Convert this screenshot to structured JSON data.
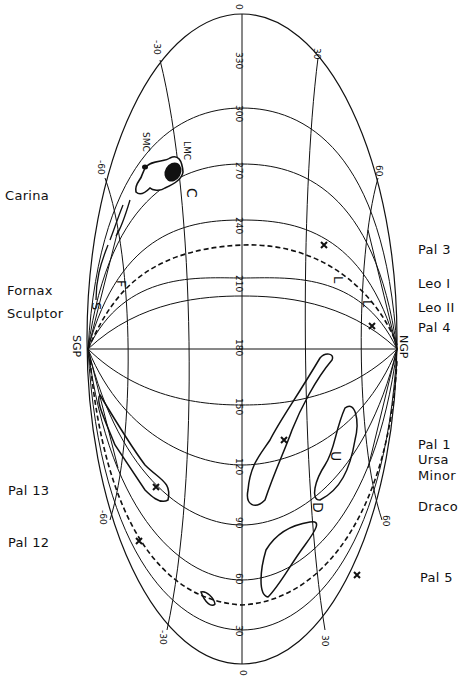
{
  "figure": {
    "projection": "Aitoff (rotated 90°)",
    "poles": {
      "left": "SGP",
      "right": "NGP"
    },
    "meridian_labels": [
      "0",
      "330",
      "300",
      "270",
      "240",
      "210",
      "180",
      "150",
      "120",
      "90",
      "60",
      "30",
      "0"
    ],
    "latitude_labels": {
      "top_left": [
        "-30",
        "-60"
      ],
      "top_right": [
        "30",
        "60"
      ],
      "bottom_left": [
        "-60",
        "-30"
      ],
      "bottom_right": [
        "60",
        "30"
      ]
    },
    "cloud_labels": [
      "SMC",
      "LMC"
    ],
    "object_letters": {
      "carina": "C",
      "fornax": "F",
      "sculptor": "S",
      "leo1": "L",
      "leo2": "L",
      "ursa_minor": "U",
      "draco": "D"
    },
    "left_labels": [
      {
        "text": "Carina",
        "y": 188
      },
      {
        "text": "Fornax",
        "y": 283
      },
      {
        "text": "Sculptor",
        "y": 306
      },
      {
        "text": "Pal 13",
        "y": 483
      },
      {
        "text": "Pal 12",
        "y": 535
      }
    ],
    "right_labels": [
      {
        "text": "Pal 3",
        "y": 242
      },
      {
        "text": "Leo I",
        "y": 276
      },
      {
        "text": "Leo II",
        "y": 300
      },
      {
        "text": "Pal 4",
        "y": 320
      },
      {
        "text": "Pal 1",
        "y": 437
      },
      {
        "text": "Ursa",
        "y": 452
      },
      {
        "text": "Minor",
        "y": 468
      },
      {
        "text": "Draco",
        "y": 499
      },
      {
        "text": "Pal 5",
        "y": 570
      }
    ]
  }
}
